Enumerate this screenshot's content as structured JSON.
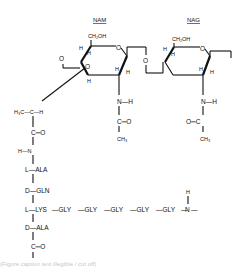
{
  "diagram": {
    "sugars": {
      "nam": {
        "label": "NAM",
        "ch2oh": "CH₂OH"
      },
      "nag": {
        "label": "NAG",
        "ch2oh": "CH₂OH"
      }
    },
    "atoms": {
      "O": "O",
      "H": "H",
      "NH": "N—H",
      "CO": "C═O",
      "OC": "O═C",
      "CH3": "CH₃",
      "lactyl": "H₃C—C—H",
      "HN": "H—N"
    },
    "peptide_stem": [
      {
        "config": "L",
        "residue": "ALA"
      },
      {
        "config": "D",
        "residue": "GLN"
      },
      {
        "config": "L",
        "residue": "LYS"
      },
      {
        "config": "D",
        "residue": "ALA"
      }
    ],
    "cross_bridge": [
      "GLY",
      "GLY",
      "GLY",
      "GLY",
      "GLY"
    ],
    "bridge_end": {
      "H": "H",
      "N": "N"
    },
    "terminal": "C═O",
    "caption": "(Figure caption text illegible / cut off)"
  }
}
